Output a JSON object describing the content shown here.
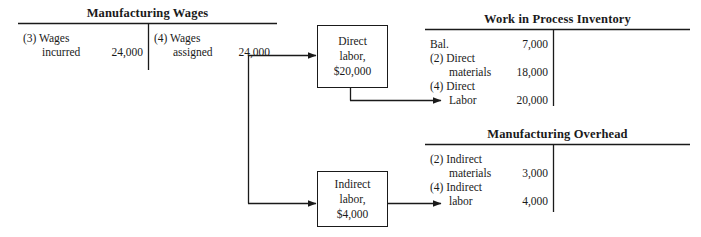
{
  "diagram": {
    "type": "t-account-flow",
    "ink_color": "#1a1a1a",
    "background_color": "#ffffff"
  },
  "accounts": [
    {
      "id": "manufacturing-wages",
      "title": "Manufacturing Wages",
      "debit_entries": [
        {
          "ref": "(3) Wages",
          "label": "incurred",
          "amount": "24,000"
        }
      ],
      "credit_entries": [
        {
          "ref": "(4) Wages",
          "label": "assigned",
          "amount": "24,000"
        }
      ]
    },
    {
      "id": "work-in-process-inventory",
      "title": "Work in Process Inventory",
      "debit_entries": [
        {
          "ref": "Bal.",
          "label": "",
          "amount": "7,000"
        },
        {
          "ref": "(2) Direct",
          "label": "materials",
          "amount": "18,000"
        },
        {
          "ref": "(4) Direct",
          "label": "Labor",
          "amount": "20,000"
        }
      ],
      "credit_entries": []
    },
    {
      "id": "manufacturing-overhead",
      "title": "Manufacturing Overhead",
      "debit_entries": [
        {
          "ref": "(2) Indirect",
          "label": "materials",
          "amount": "3,000"
        },
        {
          "ref": "(4) Indirect",
          "label": "labor",
          "amount": "4,000"
        }
      ],
      "credit_entries": []
    }
  ],
  "boxes": [
    {
      "id": "direct-labor-box",
      "line1": "Direct",
      "line2": "labor,",
      "line3": "$20,000"
    },
    {
      "id": "indirect-labor-box",
      "line1": "Indirect",
      "line2": "labor,",
      "line3": "$4,000"
    }
  ],
  "connectors": [
    {
      "id": "wages-to-direct-labor",
      "from": "manufacturing-wages",
      "to": "direct-labor-box"
    },
    {
      "id": "wages-to-indirect-labor",
      "from": "manufacturing-wages",
      "to": "indirect-labor-box"
    },
    {
      "id": "direct-labor-to-wip",
      "from": "direct-labor-box",
      "to": "work-in-process-inventory"
    },
    {
      "id": "indirect-labor-to-moh",
      "from": "indirect-labor-box",
      "to": "manufacturing-overhead"
    }
  ]
}
